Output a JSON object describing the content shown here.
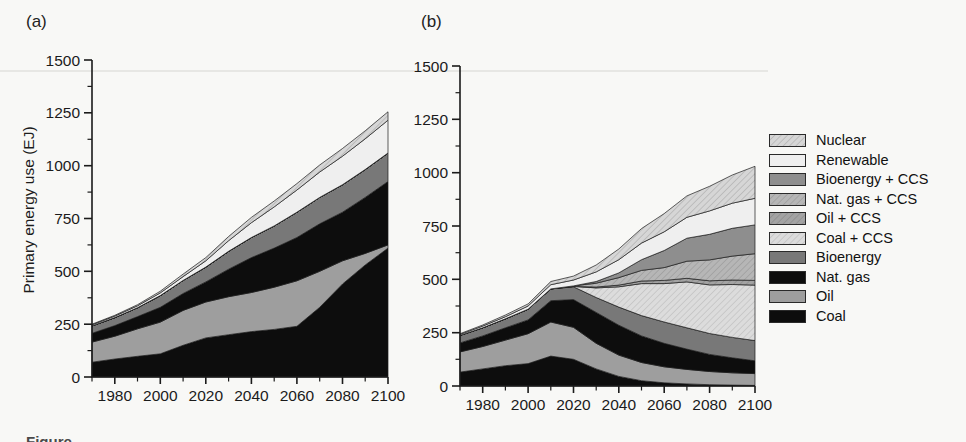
{
  "figure": {
    "panel_a_label": "(a)",
    "panel_b_label": "(b)",
    "y_axis_title": "Primary energy use (EJ)",
    "caption_partial": "Figure",
    "background": "#f8f8f6",
    "axis_color": "#1b1b1b"
  },
  "chart_data": [
    {
      "type": "area",
      "stacked": true,
      "panel": "a",
      "ylabel": "Primary energy use (EJ)",
      "xlabel": "",
      "xlim": [
        1970,
        2100
      ],
      "ylim": [
        0,
        1500
      ],
      "ytick_major": 250,
      "ytick_minor": 125,
      "xtick_minor": 10,
      "xtick_label_step": 20,
      "x": [
        1970,
        1980,
        1990,
        2000,
        2010,
        2020,
        2030,
        2040,
        2050,
        2060,
        2070,
        2080,
        2090,
        2100
      ],
      "series": [
        {
          "key": "coal",
          "label": "Coal",
          "fill": "#0d0d0d",
          "hatch": false,
          "values": [
            70,
            85,
            98,
            110,
            150,
            185,
            200,
            215,
            225,
            240,
            330,
            440,
            530,
            610
          ]
        },
        {
          "key": "oil",
          "label": "Oil",
          "fill": "#9e9e9e",
          "hatch": false,
          "values": [
            95,
            108,
            130,
            150,
            165,
            170,
            180,
            185,
            200,
            215,
            170,
            110,
            55,
            15
          ]
        },
        {
          "key": "natgas",
          "label": "Nat. gas",
          "fill": "#0d0d0d",
          "hatch": false,
          "values": [
            42,
            50,
            58,
            70,
            80,
            95,
            130,
            165,
            185,
            205,
            225,
            230,
            265,
            300
          ]
        },
        {
          "key": "bioenergy",
          "label": "Bioenergy",
          "fill": "#787878",
          "hatch": false,
          "values": [
            35,
            38,
            42,
            55,
            62,
            70,
            85,
            95,
            105,
            120,
            125,
            130,
            132,
            135
          ]
        },
        {
          "key": "coal_ccs",
          "label": "Coal + CCS",
          "fill": "#dcdcdc",
          "hatch": true,
          "hatch_line": "#bfbfbf",
          "values": [
            0,
            0,
            0,
            0,
            0,
            0,
            0,
            0,
            0,
            0,
            0,
            0,
            0,
            0
          ]
        },
        {
          "key": "oil_ccs",
          "label": "Oil + CCS",
          "fill": "#a3a3a3",
          "hatch": true,
          "hatch_line": "#8a8a8a",
          "values": [
            0,
            0,
            0,
            0,
            0,
            0,
            0,
            0,
            0,
            0,
            0,
            0,
            0,
            0
          ]
        },
        {
          "key": "natgas_ccs",
          "label": "Nat. gas + CCS",
          "fill": "#b6b6b6",
          "hatch": true,
          "hatch_line": "#9a9a9a",
          "values": [
            0,
            0,
            0,
            0,
            0,
            0,
            0,
            0,
            0,
            0,
            0,
            0,
            0,
            0
          ]
        },
        {
          "key": "bioenergy_ccs",
          "label": "Bioenergy + CCS",
          "fill": "#8e8e8e",
          "hatch": false,
          "values": [
            0,
            0,
            0,
            0,
            0,
            0,
            0,
            0,
            0,
            0,
            0,
            0,
            0,
            0
          ]
        },
        {
          "key": "renewable",
          "label": "Renewable",
          "fill": "#efefef",
          "hatch": false,
          "values": [
            5,
            7,
            9,
            13,
            18,
            30,
            50,
            70,
            90,
            105,
            120,
            135,
            145,
            155
          ]
        },
        {
          "key": "nuclear",
          "label": "Nuclear",
          "fill": "#d6d6d6",
          "hatch": true,
          "hatch_line": "#b0b0b0",
          "values": [
            3,
            4,
            5,
            8,
            12,
            15,
            20,
            25,
            28,
            30,
            33,
            36,
            38,
            40
          ]
        }
      ]
    },
    {
      "type": "area",
      "stacked": true,
      "panel": "b",
      "ylabel": "",
      "xlabel": "",
      "xlim": [
        1970,
        2100
      ],
      "ylim": [
        0,
        1500
      ],
      "ytick_major": 250,
      "ytick_minor": 125,
      "xtick_minor": 10,
      "xtick_label_step": 20,
      "x": [
        1970,
        1980,
        1990,
        2000,
        2010,
        2020,
        2030,
        2040,
        2050,
        2060,
        2070,
        2080,
        2090,
        2100
      ],
      "series": [
        {
          "key": "coal",
          "label": "Coal",
          "fill": "#0d0d0d",
          "hatch": false,
          "values": [
            65,
            80,
            95,
            105,
            140,
            125,
            80,
            45,
            25,
            15,
            10,
            6,
            4,
            3
          ]
        },
        {
          "key": "oil",
          "label": "Oil",
          "fill": "#9e9e9e",
          "hatch": false,
          "values": [
            95,
            105,
            120,
            140,
            160,
            150,
            120,
            100,
            85,
            75,
            68,
            62,
            58,
            55
          ]
        },
        {
          "key": "natgas",
          "label": "Nat. gas",
          "fill": "#0d0d0d",
          "hatch": false,
          "values": [
            42,
            50,
            58,
            65,
            100,
            130,
            145,
            140,
            125,
            110,
            95,
            80,
            70,
            60
          ]
        },
        {
          "key": "bioenergy",
          "label": "Bioenergy",
          "fill": "#787878",
          "hatch": false,
          "values": [
            35,
            38,
            42,
            50,
            55,
            60,
            70,
            85,
            95,
            100,
            100,
            98,
            96,
            95
          ]
        },
        {
          "key": "coal_ccs",
          "label": "Coal + CCS",
          "fill": "#dcdcdc",
          "hatch": true,
          "hatch_line": "#bfbfbf",
          "values": [
            0,
            0,
            0,
            0,
            0,
            2,
            45,
            95,
            150,
            180,
            215,
            228,
            248,
            260
          ]
        },
        {
          "key": "oil_ccs",
          "label": "Oil + CCS",
          "fill": "#a3a3a3",
          "hatch": true,
          "hatch_line": "#8a8a8a",
          "values": [
            0,
            0,
            0,
            0,
            0,
            0,
            4,
            8,
            12,
            15,
            17,
            19,
            21,
            22
          ]
        },
        {
          "key": "natgas_ccs",
          "label": "Nat. gas + CCS",
          "fill": "#b6b6b6",
          "hatch": true,
          "hatch_line": "#9a9a9a",
          "values": [
            0,
            0,
            0,
            0,
            0,
            2,
            18,
            35,
            50,
            60,
            80,
            98,
            112,
            125
          ]
        },
        {
          "key": "bioenergy_ccs",
          "label": "Bioenergy + CCS",
          "fill": "#8e8e8e",
          "hatch": false,
          "values": [
            0,
            0,
            0,
            0,
            0,
            0,
            8,
            22,
            50,
            80,
            108,
            120,
            130,
            135
          ]
        },
        {
          "key": "renewable",
          "label": "Renewable",
          "fill": "#efefef",
          "hatch": false,
          "values": [
            5,
            8,
            10,
            15,
            20,
            28,
            45,
            62,
            78,
            88,
            98,
            110,
            118,
            125
          ]
        },
        {
          "key": "nuclear",
          "label": "Nuclear",
          "fill": "#d6d6d6",
          "hatch": true,
          "hatch_line": "#b0b0b0",
          "values": [
            3,
            5,
            8,
            10,
            15,
            18,
            32,
            50,
            68,
            85,
            100,
            115,
            132,
            150
          ]
        }
      ]
    }
  ],
  "legend": {
    "items": [
      {
        "key": "nuclear",
        "label": "Nuclear",
        "fill": "#d6d6d6",
        "hatch": true,
        "hatch_line": "#b0b0b0"
      },
      {
        "key": "renewable",
        "label": "Renewable",
        "fill": "#efefef",
        "hatch": false
      },
      {
        "key": "bioenergy_ccs",
        "label": "Bioenergy + CCS",
        "fill": "#8e8e8e",
        "hatch": false
      },
      {
        "key": "natgas_ccs",
        "label": "Nat. gas + CCS",
        "fill": "#b6b6b6",
        "hatch": true,
        "hatch_line": "#9a9a9a"
      },
      {
        "key": "oil_ccs",
        "label": "Oil + CCS",
        "fill": "#a3a3a3",
        "hatch": true,
        "hatch_line": "#8a8a8a"
      },
      {
        "key": "coal_ccs",
        "label": "Coal + CCS",
        "fill": "#dcdcdc",
        "hatch": true,
        "hatch_line": "#bfbfbf"
      },
      {
        "key": "bioenergy",
        "label": "Bioenergy",
        "fill": "#787878",
        "hatch": false
      },
      {
        "key": "natgas",
        "label": "Nat. gas",
        "fill": "#0d0d0d",
        "hatch": false
      },
      {
        "key": "oil",
        "label": "Oil",
        "fill": "#9e9e9e",
        "hatch": false
      },
      {
        "key": "coal",
        "label": "Coal",
        "fill": "#0d0d0d",
        "hatch": false
      }
    ]
  }
}
